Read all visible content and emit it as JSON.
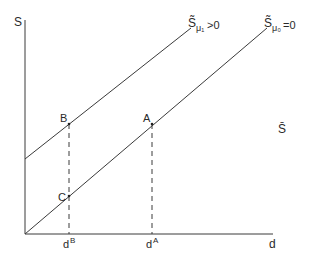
{
  "axes": {
    "y_label": "S",
    "x_label": "d"
  },
  "curves": [
    {
      "id": "mu1",
      "base": "S̃",
      "sub": "μ₁",
      "condition": ">0"
    },
    {
      "id": "mu0",
      "base": "S̃",
      "sub": "μ₀",
      "condition": "=0"
    }
  ],
  "hline_label": "S̄",
  "points": {
    "A": "A",
    "B": "B",
    "C": "C"
  },
  "ticks": {
    "dB": {
      "base": "d",
      "sup": "B"
    },
    "dA": {
      "base": "d",
      "sup": "A"
    }
  },
  "colors": {
    "line": "#3a3a3a",
    "text": "#2a2a2a"
  }
}
